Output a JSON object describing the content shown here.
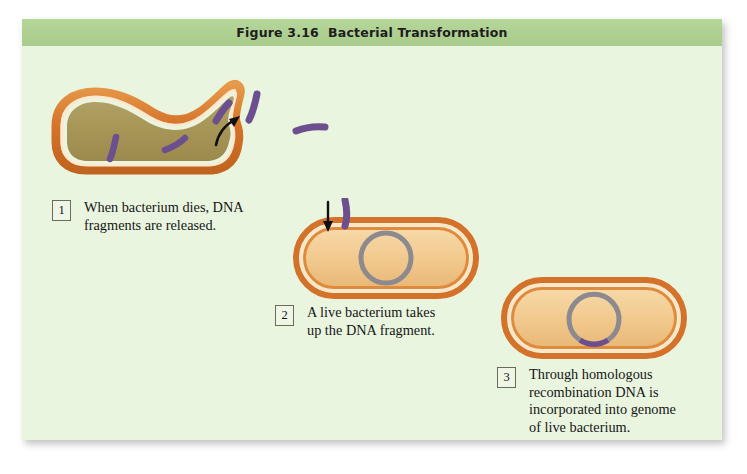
{
  "figure": {
    "title": "Figure 3.16  Bacterial Transformation",
    "title_label": "Figure 3.16",
    "title_name": "Bacterial Transformation"
  },
  "steps": [
    {
      "number": "1",
      "text": "When bacterium dies, DNA\nfragments are released.",
      "illustration": "lysing-bacterium-releasing-dna-fragments"
    },
    {
      "number": "2",
      "text": "A live bacterium takes\nup the DNA fragment.",
      "illustration": "live-bacterium-taking-up-dna-fragment"
    },
    {
      "number": "3",
      "text": "Through homologous\nrecombination DNA is\nincorporated into genome\nof live bacterium.",
      "illustration": "bacterium-with-recombined-chromosome"
    }
  ],
  "colors": {
    "panel_background": "#eaf5e0",
    "title_band": "#aed092",
    "membrane_outer": "#d4722a",
    "membrane_mid": "#f3b06a",
    "membrane_gap": "#fbe6c8",
    "cytoplasm_dead": "#a79659",
    "cytoplasm_live": "#f2cc92",
    "dna_fragment": "#6b4f8f",
    "chromosome_ring": "#8c8a8e",
    "arrow": "#111111",
    "text": "#151515"
  },
  "elements": {
    "dead_cell_label": "dead bacterium",
    "live_cell_label": "live bacterium",
    "chromosome_label": "bacterial chromosome",
    "fragment_label": "DNA fragment",
    "arrow_release_label": "release arrow",
    "arrow_uptake_label": "uptake arrow",
    "recombined_segment_label": "recombined DNA segment"
  }
}
